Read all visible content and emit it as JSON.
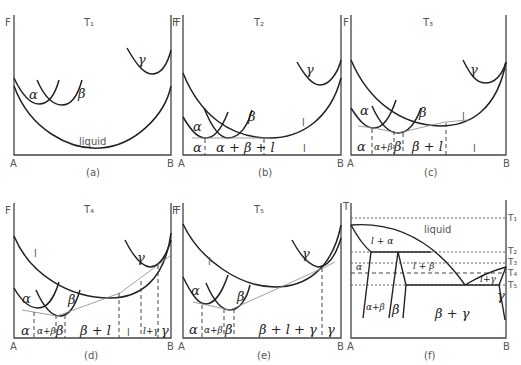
{
  "figure": {
    "axis_labels": {
      "free_energy": "F",
      "temperature": "T",
      "component_a": "A",
      "component_b": "B"
    },
    "panels": [
      {
        "id": "a",
        "caption": "(a)",
        "temperature": "T₁",
        "curve_labels": [
          "α",
          "β",
          "γ",
          "liquid"
        ],
        "region_labels": []
      },
      {
        "id": "b",
        "caption": "(b)",
        "temperature": "T₂",
        "curve_labels": [
          "α",
          "β",
          "γ",
          "l"
        ],
        "region_labels": [
          "α",
          "α + β + l",
          "l"
        ]
      },
      {
        "id": "c",
        "caption": "(c)",
        "temperature": "T₃",
        "curve_labels": [
          "α",
          "β",
          "γ",
          "l"
        ],
        "region_labels": [
          "α",
          "α+β",
          "β",
          "β + l",
          "l"
        ]
      },
      {
        "id": "d",
        "caption": "(d)",
        "temperature": "T₄",
        "curve_labels": [
          "α",
          "β",
          "γ",
          "l"
        ],
        "region_labels": [
          "α",
          "α+β",
          "β",
          "β + l",
          "l",
          "l+γ",
          "γ"
        ]
      },
      {
        "id": "e",
        "caption": "(e)",
        "temperature": "T₅",
        "curve_labels": [
          "α",
          "β",
          "γ",
          "l"
        ],
        "region_labels": [
          "α",
          "α+β",
          "β",
          "β + l + γ",
          "γ"
        ]
      },
      {
        "id": "f",
        "caption": "(f)",
        "temperature": "",
        "temperature_levels": [
          "T₁",
          "T₂",
          "T₃",
          "T₄",
          "T₅"
        ],
        "region_labels": [
          "liquid",
          "l + α",
          "α",
          "l + β",
          "l+γ",
          "α+β",
          "β",
          "β + γ",
          "γ"
        ]
      }
    ]
  }
}
